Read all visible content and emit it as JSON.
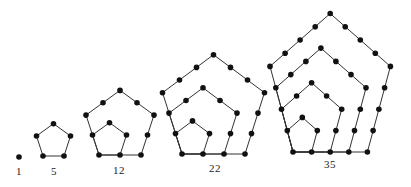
{
  "colors": {
    "dot": "#111111",
    "line": "#333333",
    "label": "#222222",
    "background": "#ffffff"
  },
  "figures": [
    {
      "n": 1,
      "label": "1",
      "layers": 1,
      "origin": [
        19,
        157
      ],
      "sx": 0,
      "sy": 0,
      "label_pos": [
        19,
        165
      ]
    },
    {
      "n": 5,
      "label": "5",
      "layers": 2,
      "origin": [
        43,
        156
      ],
      "sx": 21,
      "sy": 21,
      "label_pos": [
        54,
        165
      ]
    },
    {
      "n": 12,
      "label": "12",
      "layers": 3,
      "origin": [
        99,
        155
      ],
      "sx": 21,
      "sy": 21,
      "label_pos": [
        119,
        164
      ]
    },
    {
      "n": 22,
      "label": "22",
      "layers": 4,
      "origin": [
        182,
        154
      ],
      "sx": 21,
      "sy": 21.5,
      "label_pos": [
        215,
        162
      ]
    },
    {
      "n": 35,
      "label": "35",
      "layers": 5,
      "origin": [
        293,
        152
      ],
      "sx": 18.6,
      "sy": 22.5,
      "label_pos": [
        330,
        158
      ]
    }
  ]
}
